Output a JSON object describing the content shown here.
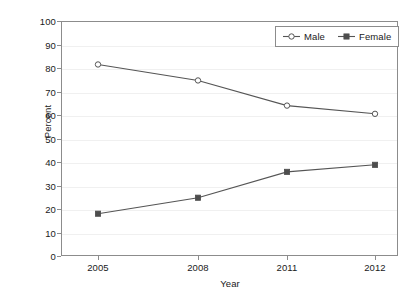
{
  "chart_data": {
    "type": "line",
    "title": "",
    "subtitle": "",
    "xlabel": "Year",
    "ylabel": "Percent",
    "categories": [
      "2005",
      "2008",
      "2011",
      "2012"
    ],
    "x": [
      "2005",
      "2008",
      "2011",
      "2012"
    ],
    "series": [
      {
        "name": "Male",
        "values": [
          81.5,
          74.7,
          64.0,
          60.5
        ],
        "marker": "open-circle",
        "color": "#555555",
        "marker_fill": "#ffffff",
        "marker_stroke": "#555555"
      },
      {
        "name": "Female",
        "values": [
          18.0,
          24.8,
          35.8,
          38.8
        ],
        "marker": "filled-square",
        "color": "#555555",
        "marker_fill": "#4d4d4d",
        "marker_stroke": "#4d4d4d"
      }
    ],
    "ylim": [
      0,
      100
    ],
    "ytick_values": [
      100,
      90,
      80,
      70,
      60,
      50,
      40,
      30,
      20,
      10,
      0
    ],
    "ytick_labels": [
      "100",
      "90",
      "80",
      "70",
      "60",
      "50",
      "40",
      "30",
      "20",
      "10",
      "0"
    ],
    "grid": true,
    "grid_axis": "y",
    "grid_color": "#f0f0f0",
    "legend_position": "top-right",
    "legend_entries": [
      "Male",
      "Female"
    ],
    "frame_color": "#8c8c8c",
    "background_color": "#ffffff",
    "text_color": "#1a1a1a",
    "annotations": []
  },
  "legend": {
    "items": [
      {
        "label": "Male",
        "icon": "open-circle-marker-icon"
      },
      {
        "label": "Female",
        "icon": "filled-square-marker-icon"
      }
    ]
  },
  "axes": {
    "y_title": "Percent",
    "x_title": "Year"
  }
}
